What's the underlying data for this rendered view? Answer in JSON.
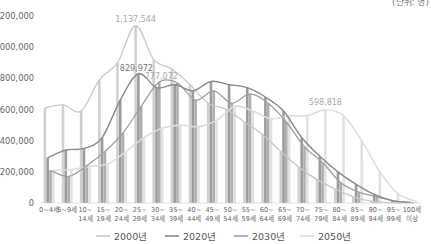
{
  "unit_label": "(단위: 명)",
  "chart_data": {
    "type": "bar",
    "title": "",
    "xlabel": "",
    "ylabel": "",
    "ylim": [
      0,
      1200000
    ],
    "yticks": [
      0,
      200000,
      400000,
      600000,
      800000,
      1000000,
      1200000
    ],
    "ytick_labels": [
      "0",
      "200,000",
      "400,000",
      "600,000",
      "800,000",
      "1,000,000",
      "1,200,000"
    ],
    "grid": false,
    "legend_position": "bottom",
    "categories": [
      [
        "0~4세"
      ],
      [
        "5~9세"
      ],
      [
        "10~",
        "14세"
      ],
      [
        "15~",
        "19세"
      ],
      [
        "20~",
        "24세"
      ],
      [
        "25~",
        "29세"
      ],
      [
        "30~",
        "34세"
      ],
      [
        "35~",
        "39세"
      ],
      [
        "40~",
        "44세"
      ],
      [
        "45~",
        "49세"
      ],
      [
        "50~",
        "54세"
      ],
      [
        "55~",
        "59세"
      ],
      [
        "60~",
        "64세"
      ],
      [
        "65~",
        "69세"
      ],
      [
        "70~",
        "74세"
      ],
      [
        "75~",
        "79세"
      ],
      [
        "80~",
        "84세"
      ],
      [
        "85~",
        "89세"
      ],
      [
        "90~",
        "94세"
      ],
      [
        "95~",
        "99세"
      ],
      [
        "100세",
        "이상"
      ]
    ],
    "series": [
      {
        "name": "2000년",
        "color": "#c8c8c8",
        "values": [
          610000,
          630000,
          590000,
          790000,
          900000,
          1137544,
          920000,
          860000,
          760000,
          640000,
          600000,
          520000,
          440000,
          330000,
          230000,
          150000,
          90000,
          40000,
          12000,
          3000,
          500
        ]
      },
      {
        "name": "2020년",
        "color": "#8a8a8a",
        "values": [
          290000,
          340000,
          350000,
          420000,
          660000,
          829972,
          740000,
          760000,
          720000,
          780000,
          760000,
          740000,
          680000,
          590000,
          420000,
          300000,
          200000,
          120000,
          55000,
          15000,
          3000
        ]
      },
      {
        "name": "2030년",
        "color": "#a0a0a0",
        "values": [
          210000,
          170000,
          240000,
          330000,
          450000,
          620000,
          777072,
          770000,
          660000,
          720000,
          640000,
          700000,
          640000,
          520000,
          360000,
          260000,
          130000,
          70000,
          40000,
          12000,
          2000
        ]
      },
      {
        "name": "2050년",
        "color": "#dedede",
        "values": [
          210000,
          215000,
          235000,
          250000,
          330000,
          420000,
          480000,
          500000,
          490000,
          530000,
          620000,
          590000,
          540000,
          560000,
          560000,
          598818,
          560000,
          400000,
          200000,
          60000,
          10000
        ]
      }
    ],
    "annotations": [
      {
        "text": "1,137,544",
        "series": "2000년",
        "category_index": 5
      },
      {
        "text": "829,972",
        "series": "2020년",
        "category_index": 5
      },
      {
        "text": "777,072",
        "series": "2030년",
        "category_index": 6
      },
      {
        "text": "598,818",
        "series": "2050년",
        "category_index": 15
      }
    ]
  }
}
